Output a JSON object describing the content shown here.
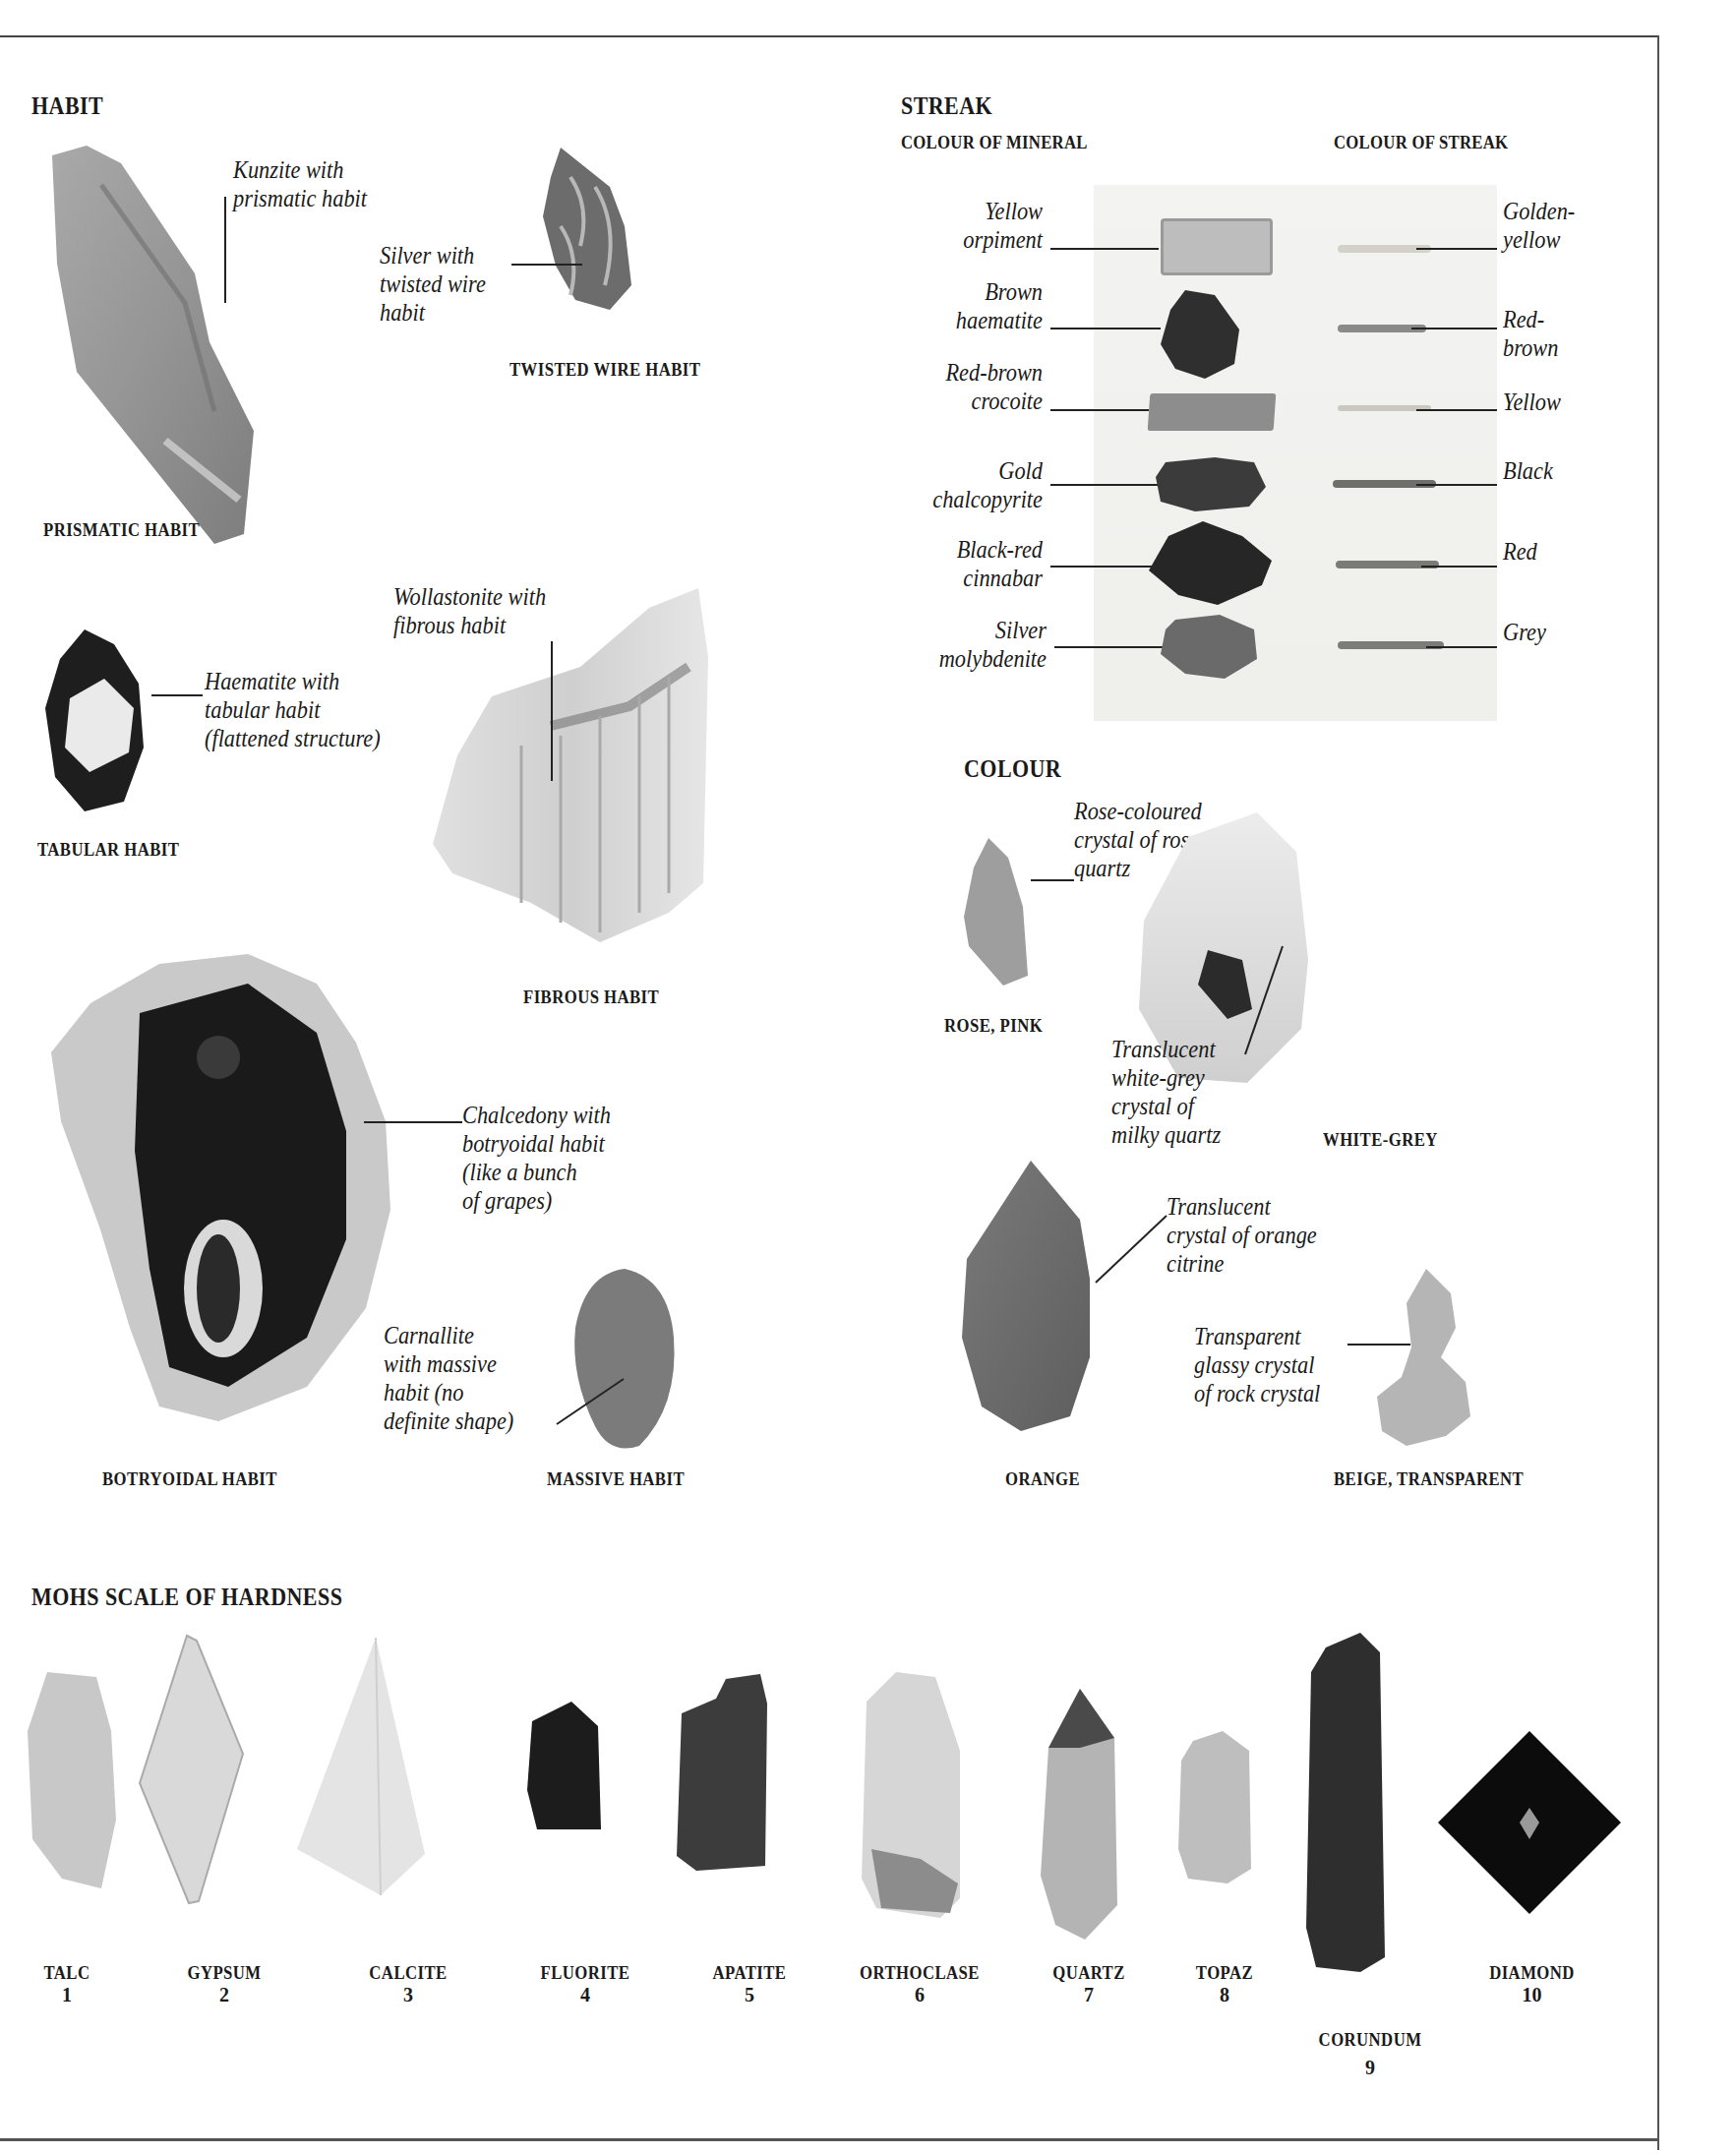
{
  "habit": {
    "heading": "HABIT",
    "prismatic": {
      "caption": "PRISMATIC HABIT",
      "annotation": "Kunzite with\nprismatic habit",
      "specimen_icon": "kunzite-crystal-icon"
    },
    "twisted_wire": {
      "caption": "TWISTED WIRE HABIT",
      "annotation": "Silver with\ntwisted wire\nhabit",
      "specimen_icon": "silver-wire-icon"
    },
    "tabular": {
      "caption": "TABULAR HABIT",
      "annotation": "Haematite with\ntabular habit\n(flattened structure)",
      "specimen_icon": "haematite-crystal-icon"
    },
    "fibrous": {
      "caption": "FIBROUS HABIT",
      "annotation": "Wollastonite with\nfibrous habit",
      "specimen_icon": "wollastonite-icon"
    },
    "botryoidal": {
      "caption": "BOTRYOIDAL HABIT",
      "annotation": "Chalcedony with\nbotryoidal habit\n(like a bunch\nof grapes)",
      "specimen_icon": "chalcedony-geode-icon"
    },
    "massive": {
      "caption": "MASSIVE HABIT",
      "annotation": "Carnallite\nwith massive\nhabit (no\ndefinite shape)",
      "specimen_icon": "carnallite-lump-icon"
    }
  },
  "streak": {
    "heading": "STREAK",
    "col_mineral": "COLOUR OF MINERAL",
    "col_streak": "COLOUR OF STREAK",
    "rows": [
      {
        "mineral": "Yellow\norpiment",
        "streak": "Golden-\nyellow",
        "streak_color": "#d4d2c8"
      },
      {
        "mineral": "Brown\nhaematite",
        "streak": "Red-\nbrown",
        "streak_color": "#8a8a86"
      },
      {
        "mineral": "Red-brown\ncrocoite",
        "streak": "Yellow",
        "streak_color": "#c9c8c2"
      },
      {
        "mineral": "Gold\nchalcopyrite",
        "streak": "Black",
        "streak_color": "#6e6e6b"
      },
      {
        "mineral": "Black-red\ncinnabar",
        "streak": "Red",
        "streak_color": "#7a7a76"
      },
      {
        "mineral": "Silver\nmolybdenite",
        "streak": "Grey",
        "streak_color": "#7c7c79"
      }
    ]
  },
  "colour": {
    "heading": "COLOUR",
    "items": [
      {
        "caption": "ROSE, PINK",
        "annotation": "Rose-coloured\ncrystal of rose\nquartz",
        "specimen_icon": "rose-quartz-icon"
      },
      {
        "caption": "WHITE-GREY",
        "annotation": "Translucent\nwhite-grey\ncrystal of\nmilky quartz",
        "specimen_icon": "milky-quartz-icon"
      },
      {
        "caption": "ORANGE",
        "annotation": "Translucent\ncrystal of orange\ncitrine",
        "specimen_icon": "citrine-icon"
      },
      {
        "caption": "BEIGE, TRANSPARENT",
        "annotation": "Transparent\nglassy crystal\nof rock crystal",
        "specimen_icon": "rock-crystal-icon"
      }
    ]
  },
  "mohs": {
    "heading": "MOHS SCALE OF HARDNESS",
    "minerals": [
      {
        "name": "TALC",
        "hardness": "1"
      },
      {
        "name": "GYPSUM",
        "hardness": "2"
      },
      {
        "name": "CALCITE",
        "hardness": "3"
      },
      {
        "name": "FLUORITE",
        "hardness": "4"
      },
      {
        "name": "APATITE",
        "hardness": "5"
      },
      {
        "name": "ORTHOCLASE",
        "hardness": "6"
      },
      {
        "name": "QUARTZ",
        "hardness": "7"
      },
      {
        "name": "TOPAZ",
        "hardness": "8"
      },
      {
        "name": "CORUNDUM",
        "hardness": "9"
      },
      {
        "name": "DIAMOND",
        "hardness": "10"
      }
    ]
  }
}
